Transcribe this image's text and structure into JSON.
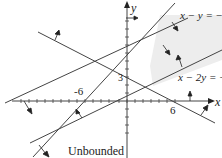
{
  "diagram": {
    "type": "linear-inequality-region",
    "axes": {
      "x_label": "x",
      "y_label": "y",
      "x_tick_labels": [
        "-6",
        "6"
      ],
      "y_tick_labels": [
        "3"
      ]
    },
    "lines": [
      {
        "equation": "x − y = −6",
        "label": "x − y = −6"
      },
      {
        "equation": "x − 2y = −2",
        "label": "x − 2y = −2"
      },
      {
        "equation": "x + 2y = 6",
        "label": ""
      }
    ],
    "region_label": "Unbounded",
    "colors": {
      "line": "#444444",
      "region": "#ececec",
      "text": "#222222"
    }
  }
}
